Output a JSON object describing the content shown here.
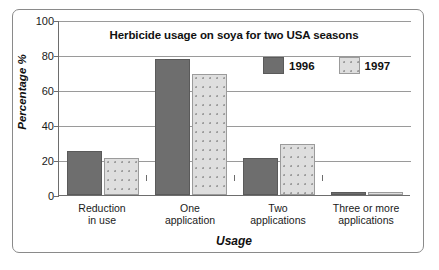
{
  "chart_data": {
    "type": "bar",
    "title": "Herbicide usage on soya for two USA seasons",
    "xlabel": "Usage",
    "ylabel": "Percentage %",
    "categories": [
      "Reduction\nin use",
      "One\napplication",
      "Two\napplications",
      "Three or more\napplications"
    ],
    "category_lines": [
      [
        "Reduction",
        "in use"
      ],
      [
        "One",
        "application"
      ],
      [
        "Two",
        "applications"
      ],
      [
        "Three or more",
        "applications"
      ]
    ],
    "series": [
      {
        "name": "1996",
        "values": [
          25,
          78,
          21,
          2
        ],
        "color": "#6e6e6e"
      },
      {
        "name": "1997",
        "values": [
          21,
          69,
          29,
          2
        ],
        "color": "#dedede"
      }
    ],
    "ylim": [
      0,
      100
    ],
    "yticks": [
      0,
      20,
      40,
      60,
      80,
      100
    ],
    "ytick_labels": [
      "0",
      "20",
      "40",
      "60",
      "80",
      "100"
    ],
    "grid": true,
    "legend_position": "upper right",
    "legend_entries": [
      "1996",
      "1997"
    ]
  },
  "frame": {
    "border_color": "#8a8a8a"
  }
}
